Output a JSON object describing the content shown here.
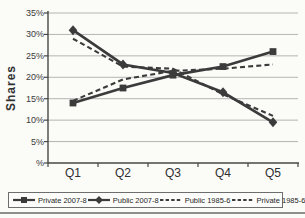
{
  "chart_data": {
    "type": "line",
    "title": "",
    "xlabel": "",
    "ylabel": "Shares",
    "categories": [
      "Q1",
      "Q2",
      "Q3",
      "Q4",
      "Q5"
    ],
    "ytick_labels": [
      "35%",
      "30%",
      "25%",
      "20%",
      "15%",
      "10%",
      "5%",
      "%"
    ],
    "ylim": [
      0,
      35
    ],
    "grid": true,
    "legend_position": "bottom",
    "axis_color": "#474747",
    "grid_color": "#b4b4b2",
    "series": [
      {
        "name": "Private 2007-8",
        "values": [
          14,
          17.5,
          20.5,
          22.5,
          26
        ],
        "style": "solid",
        "marker": "square",
        "color": "#3b3b3b"
      },
      {
        "name": "Public 2007-8",
        "values": [
          31,
          23,
          21,
          16.5,
          9.5
        ],
        "style": "solid",
        "marker": "diamond",
        "color": "#3b3b3b"
      },
      {
        "name": "Public 1985-6",
        "values": [
          29,
          22.5,
          22,
          16,
          11
        ],
        "style": "dashed",
        "marker": "none",
        "color": "#3b3b3b"
      },
      {
        "name": "Private 1985-6",
        "values": [
          14.5,
          19.5,
          21.5,
          22,
          23
        ],
        "style": "dashed",
        "marker": "none",
        "color": "#3b3b3b"
      }
    ]
  }
}
